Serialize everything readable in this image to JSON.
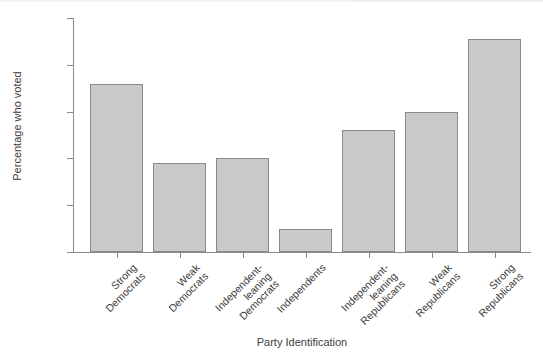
{
  "chart_data": {
    "type": "bar",
    "title": "",
    "xlabel": "Party Identification",
    "ylabel": "Percentage who voted",
    "categories": [
      "Strong\nDemocrats",
      "Weak\nDemocrats",
      "Independent-\nleaning\nDemocrats",
      "Independents",
      "Independent-\nleaning\nRepublicans",
      "Weak\nRepublicans",
      "Strong\nRepublicans"
    ],
    "values": [
      86,
      69,
      70,
      55,
      76,
      80,
      95.5
    ],
    "ylim": [
      50,
      100
    ],
    "yticks": [
      50,
      60,
      70,
      80,
      90,
      100
    ],
    "ytick_labels": [
      "50",
      "60",
      "70",
      "80",
      "90",
      "100"
    ],
    "grid": false,
    "legend": "none",
    "bar_fill_color": "#c9c9c9",
    "bar_edge_color": "#8a8a8a",
    "axis_color": "#8b8b8b"
  },
  "axis": {
    "x_title": "Party Identification",
    "y_title": "Percentage who voted"
  }
}
